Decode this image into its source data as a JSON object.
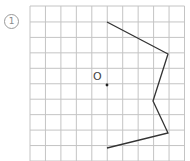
{
  "problem": {
    "number_label": "1"
  },
  "grid": {
    "x0": 30,
    "y0": 6,
    "cell": 15.45,
    "cols": 10,
    "rows": 10,
    "line_color": "#c4c4c4"
  },
  "origin": {
    "label": "O",
    "x": 107,
    "y": 85
  },
  "figure": {
    "stroke": "#333333",
    "points": [
      [
        107,
        22
      ],
      [
        168,
        54
      ],
      [
        153,
        101
      ],
      [
        168,
        133
      ],
      [
        107,
        148
      ]
    ]
  }
}
